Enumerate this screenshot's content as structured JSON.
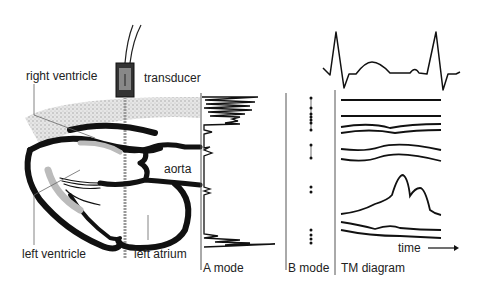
{
  "labels": {
    "right_ventricle": "right ventricle",
    "transducer": "transducer",
    "aorta": "aorta",
    "left_ventricle": "left ventricle",
    "left_atrium": "left atrium",
    "a_mode": "A mode",
    "b_mode": "B mode",
    "tm_diagram": "TM diagram",
    "time": "time"
  },
  "colors": {
    "ink": "#111111",
    "grey": "#888888",
    "stipple": "#c8c8c8"
  }
}
